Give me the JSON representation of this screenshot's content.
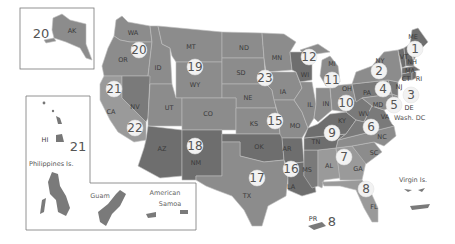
{
  "map": {
    "title": "US regional map with numbered regions",
    "colors": {
      "background": "#ffffff",
      "region_light": "#9a9a9a",
      "region_mid": "#8c8c8c",
      "region_dark": "#7a7a7a",
      "region_darker": "#6e6e6e",
      "badge_fill": "#f2f2f2",
      "border": "#bdbdbd"
    },
    "states": [
      {
        "abbr": "WA",
        "x": 133,
        "y": 33
      },
      {
        "abbr": "OR",
        "x": 123,
        "y": 60
      },
      {
        "abbr": "ID",
        "x": 158,
        "y": 68
      },
      {
        "abbr": "MT",
        "x": 191,
        "y": 47
      },
      {
        "abbr": "WY",
        "x": 195,
        "y": 85
      },
      {
        "abbr": "ND",
        "x": 244,
        "y": 48
      },
      {
        "abbr": "SD",
        "x": 241,
        "y": 73
      },
      {
        "abbr": "MN",
        "x": 277,
        "y": 58
      },
      {
        "abbr": "NE",
        "x": 248,
        "y": 98
      },
      {
        "abbr": "IA",
        "x": 283,
        "y": 92
      },
      {
        "abbr": "WI",
        "x": 305,
        "y": 75
      },
      {
        "abbr": "MI",
        "x": 332,
        "y": 64
      },
      {
        "abbr": "CA",
        "x": 111,
        "y": 112
      },
      {
        "abbr": "NV",
        "x": 135,
        "y": 107
      },
      {
        "abbr": "UT",
        "x": 169,
        "y": 108
      },
      {
        "abbr": "CO",
        "x": 208,
        "y": 114
      },
      {
        "abbr": "KS",
        "x": 254,
        "y": 124
      },
      {
        "abbr": "MO",
        "x": 295,
        "y": 126
      },
      {
        "abbr": "IL",
        "x": 310,
        "y": 105
      },
      {
        "abbr": "IN",
        "x": 326,
        "y": 104
      },
      {
        "abbr": "OH",
        "x": 347,
        "y": 89
      },
      {
        "abbr": "KY",
        "x": 342,
        "y": 121
      },
      {
        "abbr": "WV",
        "x": 364,
        "y": 114
      },
      {
        "abbr": "PA",
        "x": 367,
        "y": 93
      },
      {
        "abbr": "NY",
        "x": 380,
        "y": 61
      },
      {
        "abbr": "VT",
        "x": 404,
        "y": 57
      },
      {
        "abbr": "NH",
        "x": 412,
        "y": 62
      },
      {
        "abbr": "ME",
        "x": 413,
        "y": 37
      },
      {
        "abbr": "MA",
        "x": 410,
        "y": 71
      },
      {
        "abbr": "CT",
        "x": 406,
        "y": 79
      },
      {
        "abbr": "RI",
        "x": 419,
        "y": 79
      },
      {
        "abbr": "NJ",
        "x": 399,
        "y": 87
      },
      {
        "abbr": "MD",
        "x": 378,
        "y": 105
      },
      {
        "abbr": "DE",
        "x": 409,
        "y": 108
      },
      {
        "abbr": "VA",
        "x": 385,
        "y": 117
      },
      {
        "abbr": "NC",
        "x": 382,
        "y": 137
      },
      {
        "abbr": "SC",
        "x": 374,
        "y": 153
      },
      {
        "abbr": "GA",
        "x": 358,
        "y": 169
      },
      {
        "abbr": "AL",
        "x": 329,
        "y": 166
      },
      {
        "abbr": "MS",
        "x": 307,
        "y": 170
      },
      {
        "abbr": "TN",
        "x": 316,
        "y": 142
      },
      {
        "abbr": "AR",
        "x": 287,
        "y": 149
      },
      {
        "abbr": "LA",
        "x": 291,
        "y": 187
      },
      {
        "abbr": "OK",
        "x": 259,
        "y": 147
      },
      {
        "abbr": "TX",
        "x": 247,
        "y": 196
      },
      {
        "abbr": "AZ",
        "x": 162,
        "y": 149
      },
      {
        "abbr": "NM",
        "x": 196,
        "y": 163
      },
      {
        "abbr": "FL",
        "x": 374,
        "y": 207
      },
      {
        "abbr": "AK",
        "x": 72,
        "y": 31
      },
      {
        "abbr": "HI",
        "x": 45,
        "y": 140
      },
      {
        "abbr": "PR",
        "x": 313,
        "y": 219
      }
    ],
    "regions": [
      {
        "number": "1",
        "x": 415,
        "y": 49
      },
      {
        "number": "2",
        "x": 379,
        "y": 71
      },
      {
        "number": "3",
        "x": 411,
        "y": 95
      },
      {
        "number": "4",
        "x": 383,
        "y": 89
      },
      {
        "number": "5",
        "x": 394,
        "y": 105
      },
      {
        "number": "6",
        "x": 371,
        "y": 127
      },
      {
        "number": "7",
        "x": 344,
        "y": 157
      },
      {
        "number": "8",
        "x": 366,
        "y": 189
      },
      {
        "number": "9",
        "x": 332,
        "y": 133
      },
      {
        "number": "10",
        "x": 346,
        "y": 103
      },
      {
        "number": "11",
        "x": 332,
        "y": 80
      },
      {
        "number": "12",
        "x": 309,
        "y": 57
      },
      {
        "number": "15",
        "x": 275,
        "y": 121
      },
      {
        "number": "16",
        "x": 291,
        "y": 169
      },
      {
        "number": "17",
        "x": 257,
        "y": 178
      },
      {
        "number": "18",
        "x": 195,
        "y": 146
      },
      {
        "number": "19",
        "x": 195,
        "y": 67
      },
      {
        "number": "20",
        "x": 139,
        "y": 50
      },
      {
        "number": "21",
        "x": 114,
        "y": 89
      },
      {
        "number": "22",
        "x": 135,
        "y": 128
      },
      {
        "number": "23",
        "x": 265,
        "y": 78
      }
    ],
    "insets": {
      "alaska": {
        "label": "AK",
        "region": "20"
      },
      "hawaii": {
        "label": "HI",
        "region": "21"
      },
      "philippines": {
        "label": "Philippines Is."
      },
      "guam": {
        "label": "Guam"
      },
      "american_samoa": {
        "label_line1": "American",
        "label_line2": "Samoa"
      }
    },
    "territories": {
      "washington_dc": {
        "label": "Wash. DC"
      },
      "virgin_islands": {
        "label": "Virgin Is."
      },
      "puerto_rico": {
        "label": "PR",
        "region": "8"
      }
    }
  }
}
